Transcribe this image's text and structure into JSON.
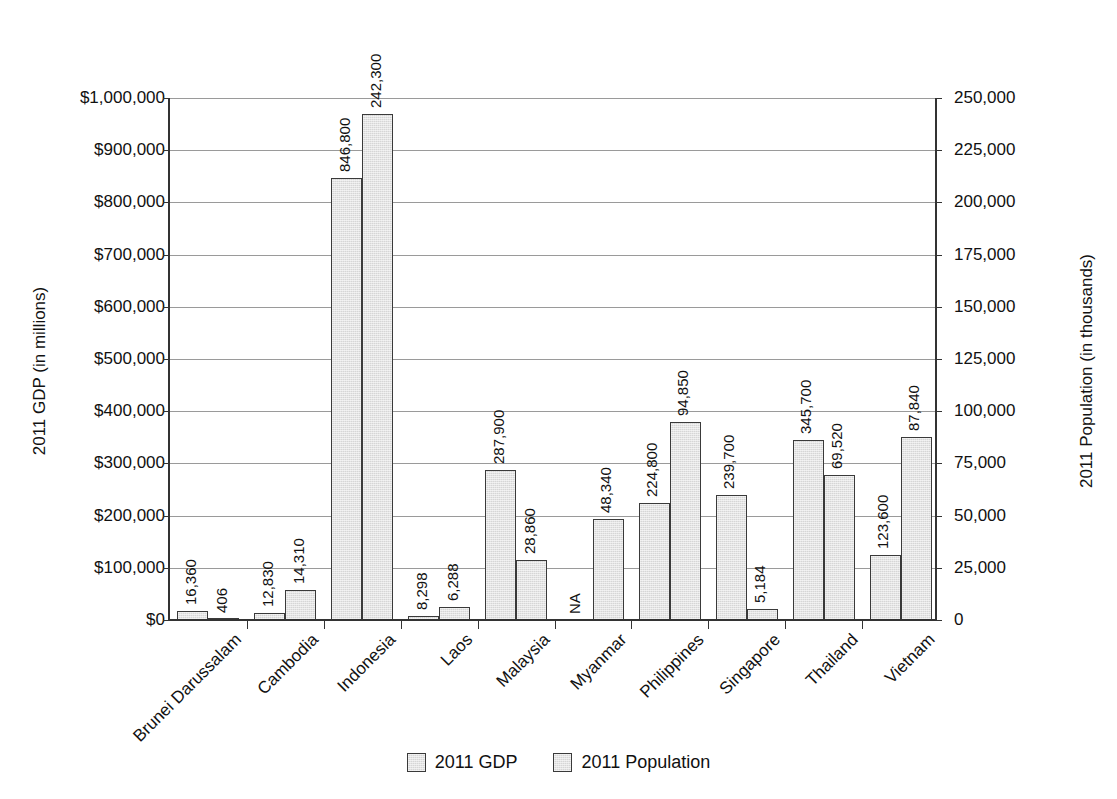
{
  "chart_data": {
    "type": "bar",
    "title": "",
    "subtitle": "",
    "xlabel": "",
    "ylabel": "2011 GDP (in millions)",
    "y2label": "2011 Population (in thousands)",
    "grid": true,
    "legend_position": "bottom",
    "categories": [
      "Brunei Darussalam",
      "Cambodia",
      "Indonesia",
      "Laos",
      "Malaysia",
      "Myanmar",
      "Philippines",
      "Singapore",
      "Thailand",
      "Vietnam"
    ],
    "series": [
      {
        "name": "2011 GDP",
        "axis": "left",
        "units": "millions USD",
        "values": [
          16360,
          12830,
          846800,
          8298,
          287900,
          null,
          224800,
          239700,
          345700,
          123600
        ],
        "labels": [
          "16,360",
          "12,830",
          "846,800",
          "8,298",
          "287,900",
          "NA",
          "224,800",
          "239,700",
          "345,700",
          "123,600"
        ]
      },
      {
        "name": "2011 Population",
        "axis": "right",
        "units": "thousands",
        "values": [
          406,
          14310,
          242300,
          6288,
          28860,
          48340,
          94850,
          5184,
          69520,
          87840
        ],
        "labels": [
          "406",
          "14,310",
          "242,300",
          "6,288",
          "28,860",
          "48,340",
          "94,850",
          "5,184",
          "69,520",
          "87,840"
        ]
      }
    ],
    "ylim": [
      0,
      1000000
    ],
    "y2lim": [
      0,
      250000
    ],
    "yticks": [
      0,
      100000,
      200000,
      300000,
      400000,
      500000,
      600000,
      700000,
      800000,
      900000,
      1000000
    ],
    "yticklabels": [
      "$0",
      "$100,000",
      "$200,000",
      "$300,000",
      "$400,000",
      "$500,000",
      "$600,000",
      "$700,000",
      "$800,000",
      "$900,000",
      "$1,000,000"
    ],
    "y2ticks": [
      0,
      25000,
      50000,
      75000,
      100000,
      125000,
      150000,
      175000,
      200000,
      225000,
      250000
    ],
    "y2ticklabels": [
      "0",
      "25,000",
      "50,000",
      "75,000",
      "100,000",
      "125,000",
      "150,000",
      "175,000",
      "200,000",
      "225,000",
      "250,000"
    ],
    "colors": {
      "bar_fill": "#d6d6d6",
      "bar_edge": "#3a3a3a",
      "gridline": "#9a9a9a",
      "axis": "#333333",
      "text": "#111111",
      "background": "#ffffff"
    }
  },
  "legend": {
    "items": [
      {
        "label": "2011 GDP"
      },
      {
        "label": "2011 Population"
      }
    ]
  }
}
